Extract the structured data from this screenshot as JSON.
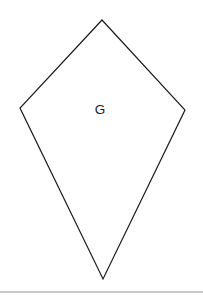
{
  "figure": {
    "background_color": "#ffffff",
    "shape": {
      "name": "kite",
      "label": "G",
      "stroke_color": "#1a1a1a",
      "fill_color": "#ffffff",
      "stroke_width": 1.2,
      "vertices": [
        {
          "name": "top",
          "x": 102,
          "y": 20
        },
        {
          "name": "right",
          "x": 185,
          "y": 110
        },
        {
          "name": "bottom",
          "x": 103,
          "y": 279
        },
        {
          "name": "left",
          "x": 20,
          "y": 108
        }
      ],
      "points_attr": "102,20 185,110 103,279 20,108",
      "label_position": {
        "x": 100,
        "y": 110
      }
    },
    "divider": {
      "color": "#c9c9c9",
      "top": 291
    }
  }
}
